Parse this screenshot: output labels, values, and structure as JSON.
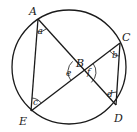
{
  "diagram": {
    "type": "circle-geometry",
    "stroke_color": "#1a1a1a",
    "background": "#ffffff",
    "circle": {
      "cx": 69,
      "cy": 67,
      "r": 57
    },
    "points": {
      "A": {
        "label": "A",
        "x": 38,
        "y": 19
      },
      "B": {
        "label": "B",
        "x": 82,
        "y": 72
      },
      "C": {
        "label": "C",
        "x": 120,
        "y": 43
      },
      "D": {
        "label": "D",
        "x": 116,
        "y": 105
      },
      "E": {
        "label": "E",
        "x": 31,
        "y": 111
      }
    },
    "segments": [
      "AE",
      "AD",
      "EC",
      "CD"
    ],
    "angles": {
      "a": {
        "label": "a",
        "vertex": "A"
      },
      "b": {
        "label": "b",
        "vertex": "C"
      },
      "c": {
        "label": "c",
        "vertex": "E"
      },
      "d": {
        "label": "d",
        "vertex": "D"
      },
      "e": {
        "label": "e",
        "vertex": "B"
      },
      "f": {
        "label": "f",
        "vertex": "B"
      }
    }
  }
}
